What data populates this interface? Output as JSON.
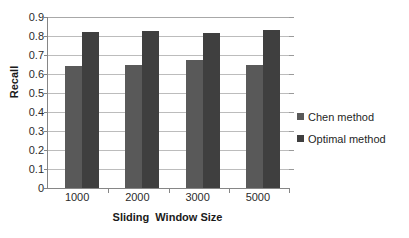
{
  "chart_data": {
    "type": "bar",
    "title": "",
    "subtitle": "",
    "xlabel": "Sliding  Window Size",
    "ylabel": "Recall",
    "categories": [
      "1000",
      "2000",
      "3000",
      "5000"
    ],
    "series": [
      {
        "name": "Chen method",
        "color": "#595959",
        "values": [
          0.64,
          0.65,
          0.675,
          0.645
        ]
      },
      {
        "name": "Optimal method",
        "color": "#3f3f3f",
        "values": [
          0.82,
          0.825,
          0.815,
          0.83
        ]
      }
    ],
    "ylim": [
      0,
      0.9
    ],
    "ytick_step": 0.1,
    "ytick_labels": [
      "0.9",
      "0.8",
      "0.7",
      "0.6",
      "0.5",
      "0.4",
      "0.3",
      "0.2",
      "0.1",
      "0"
    ],
    "ytick_values": [
      0.9,
      0.8,
      0.7,
      0.6,
      0.5,
      0.4,
      0.3,
      0.2,
      0.1,
      0
    ],
    "grid": "horizontal",
    "legend_position": "right",
    "legend_entries": [
      "Chen method",
      "Optimal method"
    ],
    "annotations": []
  },
  "style": {
    "plot_background": "#ffffff",
    "gridline_color": "#bcbcbc",
    "axis_color": "#868686",
    "text_color": "#2b2b2b"
  }
}
